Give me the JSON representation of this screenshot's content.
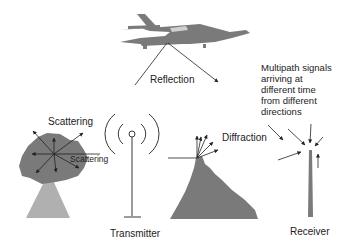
{
  "labels": {
    "reflection": "Reflection",
    "scattering_top": "Scattering",
    "scattering_inner": "Scattering",
    "diffraction": "Diffraction",
    "transmitter": "Transmitter",
    "receiver": "Receiver",
    "multipath": [
      "Multipath signals",
      "arriving at",
      "different time",
      "from different",
      "directions"
    ]
  },
  "objects": {
    "airplane": "airplane-reflector",
    "tree": "tree-scatterer",
    "mountain": "mountain-diffractor",
    "transmitter": "transmitter-antenna",
    "receiver": "receiver-antenna"
  },
  "colors": {
    "object_fill": "#7a7a7a",
    "tree_trunk": "#b0b0b0",
    "line": "#222222",
    "text": "#222222"
  }
}
